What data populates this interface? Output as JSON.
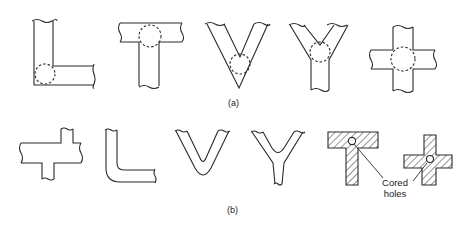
{
  "figure": {
    "row_a": {
      "label": "(a)",
      "shapes": [
        "L-junction",
        "T-junction",
        "V-junction",
        "Y-junction",
        "X-junction (cross)"
      ],
      "note": "Dashed circles indicate heavy sections / hot spots at junctions"
    },
    "row_b": {
      "label": "(b)",
      "shapes": [
        "Staggered cross",
        "Rounded L",
        "Rounded V (U)",
        "Rounded Y",
        "T with cored hole",
        "Cross with cored hole"
      ],
      "annotation": "Cored holes"
    },
    "colors": {
      "line": "#2a2a2a",
      "hatch": "#2a2a2a",
      "background": "#ffffff"
    }
  }
}
